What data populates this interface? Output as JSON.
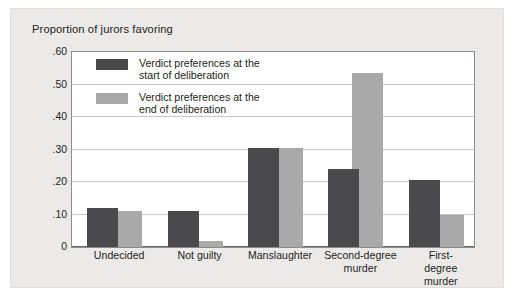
{
  "chart_data": {
    "type": "bar",
    "title": "Proportion of jurors favoring",
    "xlabel": "",
    "ylabel": "",
    "ylim": [
      0,
      0.6
    ],
    "ytick_labels": [
      ".60",
      ".50",
      ".40",
      ".30",
      ".20",
      ".10",
      "0"
    ],
    "ytick_values": [
      0.6,
      0.5,
      0.4,
      0.3,
      0.2,
      0.1,
      0
    ],
    "grid": "horizontal",
    "legend_position": "inside-upper-left",
    "categories": [
      "Undecided",
      "Not guilty",
      "Manslaughter",
      "Second-degree\nmurder",
      "First-degree\nmurder"
    ],
    "series": [
      {
        "name": "Verdict preferences at the\nstart of deliberation",
        "color": "#4a4a4c",
        "values": [
          0.12,
          0.11,
          0.305,
          0.24,
          0.205
        ]
      },
      {
        "name": "Verdict preferences at the\nend of deliberation",
        "color": "#a9a9aa",
        "values": [
          0.11,
          0.02,
          0.305,
          0.535,
          0.1
        ]
      }
    ]
  },
  "colors": {
    "panel_background": "#eceae9",
    "plot_background": "#ffffff",
    "gridline": "#c9c9c9",
    "axis": "#8c8c8c",
    "text": "#231f20",
    "series_start": "#4a4a4c",
    "series_end": "#a9a9aa"
  }
}
